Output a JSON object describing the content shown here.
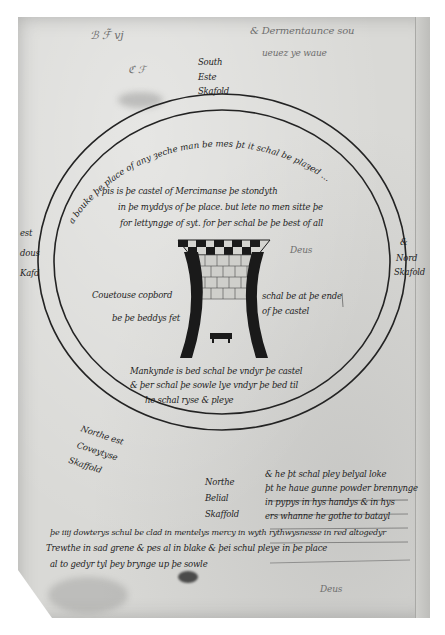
{
  "document": {
    "type": "manuscript-page",
    "description": "Medieval Middle-English diagram of a castle/tower inside a circular inscription band",
    "colors": {
      "parchment": "#d9d9d6",
      "ink": "#1e1e1e",
      "background": "#ffffff"
    }
  },
  "top_margin": {
    "scribble_left": "ℬ ℱ̃ vj",
    "scribble_right_line1": "& Dermentaunce sou",
    "scribble_right_line2": "ueuez ye waue",
    "small_mark": "ℭ ℱ",
    "label_lines": [
      "South",
      "Este",
      "Skafold"
    ]
  },
  "ring_inscription": {
    "top_arc": "a bouke þe place of any ȝeche man be mes þt it schal be plaȝed ..."
  },
  "left_margin": {
    "label_lines": [
      "est",
      "dous",
      "Kafd"
    ]
  },
  "right_margin": {
    "label_lines": [
      "&",
      "Nord",
      "Skafold"
    ]
  },
  "inner_text": {
    "top_block": [
      "þis is þe castel of Mercimanse þe stondyth",
      "in þe myddys of þe place. but lete no men sitte þe",
      "for lettyngge of syt. for þer schal be þe best of all"
    ],
    "side_mark": "Deus",
    "left_of_tower": [
      "Couetouse copbord",
      "be þe beddys fet"
    ],
    "right_of_tower": [
      "schal be at þe ende",
      "of þe castel"
    ],
    "below_tower": [
      "Mankynde is bed schal be vndyr þe castel",
      "& þer schal þe sowle lye vndyr þe bed til",
      "he schal ryse & pleye"
    ]
  },
  "bottom_left_label": [
    "Northe est",
    "Coveytyse",
    "Skaffold"
  ],
  "bottom_center_label": [
    "Northe",
    "Belial",
    "Skaffold"
  ],
  "bottom_right_block": [
    "& he þt schal pley belyal loke",
    "þt he haue gunne powder brennynge",
    "in pypys in hys handys & in hys",
    "ers whanne he gothe to batayl"
  ],
  "footer_block": [
    "þe iiij dowterys schul be clad in mentelys mercy in wyth rythwysnesse in red altogedyr",
    "Trewthe in sad grene & pes al in blake & þei schul pleye in þe place",
    "al to gedyr tyl þey brynge up þe sowle"
  ],
  "footer_mark": "Deus"
}
